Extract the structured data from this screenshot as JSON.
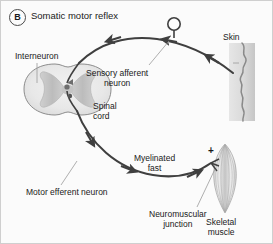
{
  "figure": {
    "panel_letter": "B",
    "title": "Somatic motor reflex"
  },
  "labels": {
    "interneuron": "Interneuron",
    "spinal_cord_line1": "Spinal",
    "spinal_cord_line2": "cord",
    "sensory_line1": "Sensory afferent",
    "sensory_line2": "neuron",
    "skin": "Skin",
    "myelinated_line1": "Myelinated",
    "myelinated_line2": "fast",
    "motor_efferent": "Motor efferent neuron",
    "nmj_line1": "Neuromuscular",
    "nmj_line2": "junction",
    "skeletal_line1": "Skeletal",
    "skeletal_line2": "muscle",
    "excitatory_sign": "+"
  },
  "colors": {
    "background": "#fbfbfb",
    "border": "#cfcfcf",
    "text": "#1a1a1a",
    "pathway": "#3f3f3f",
    "leader": "#9a9a9a",
    "cord_outline": "#8d8d8d",
    "cord_white_matter": "#ebebeb",
    "cord_gray_matter": "#c9c9c9",
    "skin_band": "#d8d8d8",
    "skin_edge": "#8a8a8a",
    "muscle_light": "#e8e8e8",
    "muscle_dark": "#9e9e9e"
  }
}
